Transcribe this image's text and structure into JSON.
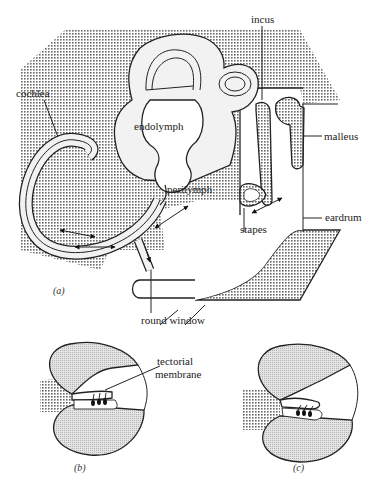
{
  "figure": {
    "panel_a": {
      "tag": "(a)",
      "labels": {
        "cochlea": "cochlea",
        "endolymph": "endolymph",
        "perilymph": "perilymph",
        "incus": "incus",
        "malleus": "malleus",
        "stapes": "stapes",
        "eardrum": "eardrum",
        "round_window": "round window"
      }
    },
    "panel_b": {
      "tag": "(b)",
      "labels": {
        "tectorial_line1": "tectorial",
        "tectorial_line2": "membrane"
      }
    },
    "panel_c": {
      "tag": "(c)"
    }
  },
  "colors": {
    "bone_fill": "#c8c8c8",
    "fluid_fill": "#f2f2f2",
    "outline": "#222222"
  }
}
